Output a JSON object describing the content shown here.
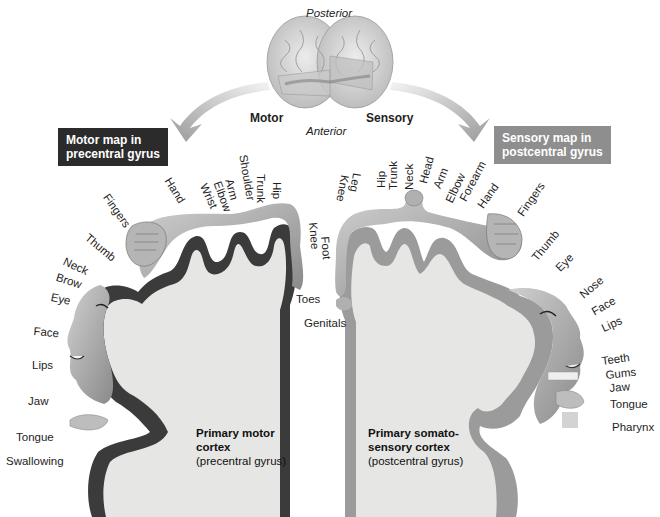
{
  "orientation": {
    "top": "Posterior",
    "bottom": "Anterior"
  },
  "arrows": {
    "left": "Motor",
    "right": "Sensory"
  },
  "colors": {
    "motor_box": "#2b2b2b",
    "sensory_box": "#8e8e8e",
    "motor_cortex": "#3a3a3a",
    "sensory_cortex": "#9a9a9a",
    "white_matter": "#e8e8e6",
    "homunculus": "#a8a8a8"
  },
  "motor": {
    "box_title_line1": "Motor map in",
    "box_title_line2": "precentral gyrus",
    "caption_bold_line1": "Primary motor",
    "caption_bold_line2": "cortex",
    "caption_sub": "(precentral gyrus)",
    "labels": [
      "Hip",
      "Trunk",
      "Shoulder",
      "Arm",
      "Elbow",
      "Wrist",
      "Hand",
      "Fingers",
      "Thumb",
      "Neck",
      "Brow",
      "Eye",
      "Face",
      "Lips",
      "Jaw",
      "Tongue",
      "Swallowing",
      "Knee",
      "Foot",
      "Toes"
    ]
  },
  "sensory": {
    "box_title_line1": "Sensory map in",
    "box_title_line2": "postcentral gyrus",
    "caption_bold_line1": "Primary somato-",
    "caption_bold_line2": "sensory cortex",
    "caption_sub": "(postcentral gyrus)",
    "labels": [
      "Genitals",
      "Knee",
      "Leg",
      "Hip",
      "Trunk",
      "Neck",
      "Head",
      "Arm",
      "Elbow",
      "Forearm",
      "Hand",
      "Fingers",
      "Thumb",
      "Eye",
      "Nose",
      "Face",
      "Lips",
      "Teeth",
      "Gums",
      "Jaw",
      "Tongue",
      "Pharynx"
    ]
  }
}
